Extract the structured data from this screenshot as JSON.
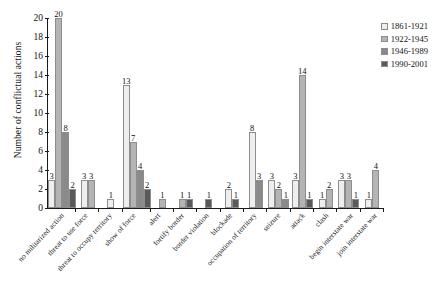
{
  "chart_data": {
    "type": "bar",
    "title": "",
    "xlabel": "",
    "ylabel": "Number of conflictual actions",
    "ylim": [
      0,
      20
    ],
    "yticks": [
      0,
      2,
      4,
      6,
      8,
      10,
      12,
      14,
      16,
      18,
      20
    ],
    "grid": false,
    "legend_position": "top-right",
    "categories": [
      "no militarized action",
      "threat to use force",
      "threat to occupy territory",
      "show of force",
      "alert",
      "fortify border",
      "border violation",
      "blockade",
      "occupation of territory",
      "seizure",
      "attack",
      "clash",
      "begin interstate war",
      "join interstate war"
    ],
    "series": [
      {
        "name": "1861-1921",
        "color": "#eeeeee",
        "values": [
          3,
          3,
          1,
          13,
          0,
          0,
          0,
          2,
          8,
          3,
          3,
          1,
          3,
          1
        ]
      },
      {
        "name": "1922-1945",
        "color": "#b4b4b4",
        "values": [
          20,
          3,
          0,
          7,
          1,
          1,
          0,
          0,
          0,
          2,
          14,
          2,
          3,
          4
        ]
      },
      {
        "name": "1946-1989",
        "color": "#8a8a8a",
        "values": [
          8,
          0,
          0,
          4,
          0,
          0,
          0,
          0,
          3,
          1,
          0,
          0,
          0,
          0
        ]
      },
      {
        "name": "1990-2001",
        "color": "#5a5a5a",
        "values": [
          2,
          0,
          0,
          2,
          0,
          1,
          1,
          1,
          0,
          0,
          1,
          0,
          1,
          0
        ]
      }
    ]
  }
}
